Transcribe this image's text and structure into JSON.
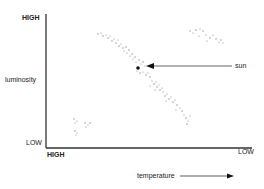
{
  "diagram": {
    "y_axis": {
      "label": "luminosity",
      "top_label": "HIGH",
      "bottom_label": "LOW"
    },
    "x_axis": {
      "label": "temperature",
      "left_label": "HIGH",
      "right_label": "LOW"
    },
    "annotation": {
      "label": "sun"
    },
    "colors": {
      "axis": "#333333",
      "dots": "#888888",
      "sun": "#111111"
    },
    "groups": [
      {
        "name": "main-sequence",
        "description": "diagonal band from upper-left to lower-right"
      },
      {
        "name": "giants",
        "description": "cluster at upper right"
      },
      {
        "name": "white-dwarfs",
        "description": "cluster at lower left"
      }
    ]
  }
}
